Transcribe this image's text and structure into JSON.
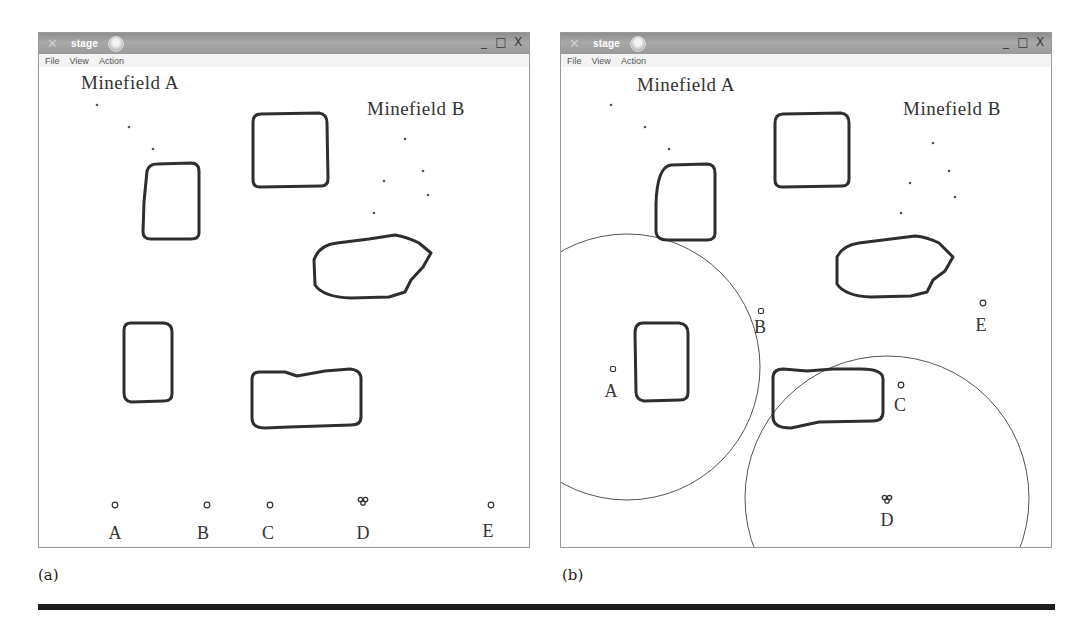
{
  "figure": {
    "panels": [
      {
        "id": "a",
        "caption": "(a)",
        "window": {
          "title": "stage",
          "close_glyph": "✕",
          "controls": {
            "minimize": "_",
            "maximize": "□",
            "close": "X"
          },
          "menu": [
            "File",
            "View",
            "Action"
          ]
        },
        "minefield_labels": [
          {
            "text": "Minefield A",
            "x": 42,
            "y": 22,
            "size": 19
          },
          {
            "text": "Minefield B",
            "x": 328,
            "y": 48,
            "size": 19
          }
        ],
        "mines": [
          [
            58,
            38
          ],
          [
            90,
            60
          ],
          [
            114,
            82
          ],
          [
            366,
            72
          ],
          [
            384,
            104
          ],
          [
            345,
            114
          ],
          [
            389,
            128
          ],
          [
            335,
            146
          ]
        ],
        "obstacles": [
          "M105,135 L108,104 Q110,97 118,97 L152,96 Q160,96 160,104 L160,166 Q160,172 152,172 L112,172 Q104,172 104,165 Z",
          "M214,55 Q214,47 222,47 L280,46 Q288,47 288,56 L289,112 Q289,119 282,119 L221,120 Q214,120 214,113 Z",
          "M275,193 Q280,178 298,176 L330,172 L356,168 Q368,170 380,176 L392,186 L384,200 L372,213 L366,225 L350,230 L312,231 Q284,230 276,218 Z",
          "M85,263 Q85,256 92,256 L125,256 Q133,257 133,265 L133,327 Q133,334 125,334 L92,335 Q85,334 85,326 Z",
          "M213,312 Q213,305 221,305 L246,305 L258,309 L286,304 L311,302 Q322,303 322,312 L322,350 Q322,358 312,358 L250,360 L226,361 Q213,361 213,351 Z"
        ],
        "robots": [
          {
            "label": "A",
            "x": 76,
            "y": 438,
            "lx": 76,
            "ly": 472
          },
          {
            "label": "B",
            "x": 168,
            "y": 438,
            "lx": 164,
            "ly": 472
          },
          {
            "label": "C",
            "x": 231,
            "y": 438,
            "lx": 229,
            "ly": 472
          },
          {
            "label": "D",
            "x": 324,
            "y": 434,
            "lx": 324,
            "ly": 472,
            "kind": "cluster"
          },
          {
            "label": "E",
            "x": 452,
            "y": 438,
            "lx": 449,
            "ly": 470
          }
        ],
        "circles": []
      },
      {
        "id": "b",
        "caption": "(b)",
        "window": {
          "title": "stage",
          "close_glyph": "✕",
          "controls": {
            "minimize": "_",
            "maximize": "□",
            "close": "X"
          },
          "menu": [
            "File",
            "View",
            "Action"
          ]
        },
        "minefield_labels": [
          {
            "text": "Minefield A",
            "x": 76,
            "y": 24,
            "size": 19
          },
          {
            "text": "Minefield B",
            "x": 342,
            "y": 48,
            "size": 19
          }
        ],
        "mines": [
          [
            50,
            38
          ],
          [
            84,
            60
          ],
          [
            108,
            82
          ],
          [
            372,
            76
          ],
          [
            388,
            104
          ],
          [
            349,
            116
          ],
          [
            394,
            130
          ],
          [
            340,
            146
          ]
        ],
        "obstacles": [
          "M95,137 Q96,100 110,98 L146,97 Q154,97 154,106 L154,166 Q154,173 146,173 L106,173 Q96,173 95,165 Z",
          "M214,56 Q214,47 222,47 L280,46 Q288,47 288,56 L288,112 Q288,119 281,119 L221,120 Q214,120 214,113 Z",
          "M276,190 Q282,178 298,176 L330,172 L354,169 Q366,170 378,176 L392,190 L384,204 L372,213 L366,225 L350,229 L310,230 Q284,229 276,217 Z",
          "M74,266 Q74,256 82,256 L118,256 Q127,257 127,266 L127,326 Q127,333 119,333 L83,334 Q75,333 75,325 Z",
          "M212,311 Q212,302 222,302 L246,304 L272,302 L300,302 Q322,302 322,312 L322,345 Q322,354 312,354 L258,355 L230,361 Q212,361 212,350 Z"
        ],
        "robots": [
          {
            "label": "A",
            "x": 52,
            "y": 302,
            "lx": 50,
            "ly": 330,
            "kind": "square"
          },
          {
            "label": "B",
            "x": 200,
            "y": 244,
            "lx": 199,
            "ly": 266,
            "kind": "square"
          },
          {
            "label": "C",
            "x": 340,
            "y": 318,
            "lx": 339,
            "ly": 344
          },
          {
            "label": "D",
            "x": 326,
            "y": 432,
            "lx": 326,
            "ly": 459,
            "kind": "cluster"
          },
          {
            "label": "E",
            "x": 422,
            "y": 236,
            "lx": 420,
            "ly": 264
          }
        ],
        "circles": [
          {
            "cx": 66,
            "cy": 300,
            "r": 133
          },
          {
            "cx": 326,
            "cy": 431,
            "r": 142
          }
        ]
      }
    ]
  }
}
